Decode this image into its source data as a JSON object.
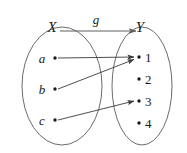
{
  "figure": {
    "type": "function-mapping-diagram",
    "background_color": "#ffffff",
    "stroke_color": "#3a3a3a",
    "ellipse_stroke_color": "#5a5a5a",
    "text_color": "#1a1a1a",
    "map_label": "g",
    "domain": {
      "name": "X",
      "elements": [
        {
          "label": "a",
          "cx": 55,
          "cy": 58,
          "text_x": 42,
          "text_y": 63
        },
        {
          "label": "b",
          "cx": 55,
          "cy": 89,
          "text_x": 42,
          "text_y": 94
        },
        {
          "label": "c",
          "cx": 55,
          "cy": 120,
          "text_x": 42,
          "text_y": 125
        }
      ],
      "ellipse": {
        "cx": 62,
        "cy": 86,
        "rx": 40,
        "ry": 59
      },
      "label_x": 52,
      "label_y": 32
    },
    "codomain": {
      "name": "Y",
      "elements": [
        {
          "label": "1",
          "cx": 139,
          "cy": 57,
          "text_x": 145,
          "text_y": 62
        },
        {
          "label": "2",
          "cx": 139,
          "cy": 79,
          "text_x": 145,
          "text_y": 84
        },
        {
          "label": "3",
          "cx": 139,
          "cy": 101,
          "text_x": 145,
          "text_y": 106
        },
        {
          "label": "4",
          "cx": 139,
          "cy": 123,
          "text_x": 145,
          "text_y": 128
        }
      ],
      "ellipse": {
        "cx": 142,
        "cy": 86,
        "rx": 30,
        "ry": 59
      },
      "label_x": 140,
      "label_y": 32
    },
    "mappings": [
      {
        "from": "a",
        "to": "1",
        "x1": 58,
        "y1": 58,
        "x2": 134,
        "y2": 57
      },
      {
        "from": "b",
        "to": "1",
        "x1": 58,
        "y1": 89,
        "x2": 134,
        "y2": 59
      },
      {
        "from": "c",
        "to": "3",
        "x1": 58,
        "y1": 120,
        "x2": 134,
        "y2": 101
      }
    ],
    "map_arrow": {
      "x1": 60,
      "y1": 31,
      "x2": 136,
      "y2": 31,
      "label_x": 96,
      "label_y": 24
    }
  }
}
